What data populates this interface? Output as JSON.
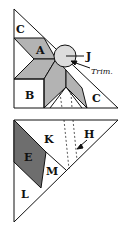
{
  "colors": {
    "shade": "#b3b3b3",
    "dark": "#6e6e6e",
    "line": "#111111",
    "light": "#dcdcdc"
  },
  "top_diagram": {
    "labels": {
      "c1": "C",
      "a": "A",
      "j": "J",
      "trim": "Trim.",
      "b": "B",
      "c2": "C"
    }
  },
  "bottom_diagram": {
    "labels": {
      "k": "K",
      "h": "H",
      "e": "E",
      "m": "M",
      "l": "L"
    }
  }
}
